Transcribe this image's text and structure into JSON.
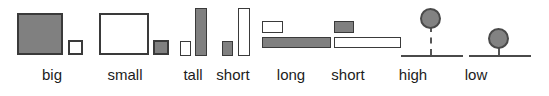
{
  "figure": {
    "title": "",
    "background_color": "#ffffff",
    "stroke_color": "#3a3a3a",
    "fill_gray": "#808080",
    "fill_white": "#ffffff",
    "width": 549,
    "height": 96
  },
  "groups": [
    {
      "label": "big",
      "concept": "size-area",
      "target_shape": "large-gray-square",
      "contrast_shape": "small-white-square"
    },
    {
      "label": "small",
      "concept": "size-area",
      "target_shape": "small-gray-square",
      "contrast_shape": "large-white-square"
    },
    {
      "label": "tall",
      "concept": "height",
      "target_shape": "tall-gray-bar",
      "contrast_shape": "short-white-bar"
    },
    {
      "label": "short",
      "concept": "height",
      "target_shape": "short-gray-bar",
      "contrast_shape": "tall-white-bar"
    },
    {
      "label": "long",
      "concept": "length",
      "target_shape": "long-gray-bar",
      "contrast_shape": "short-white-bar"
    },
    {
      "label": "short",
      "concept": "length",
      "target_shape": "short-gray-bar",
      "contrast_shape": "long-white-bar"
    },
    {
      "label": "high",
      "concept": "vertical-position",
      "target_shape": "gray-circle-high-above-baseline",
      "contrast_shape": "baseline-with-dashed-connector"
    },
    {
      "label": "low",
      "concept": "vertical-position",
      "target_shape": "gray-circle-low-above-baseline",
      "contrast_shape": "baseline-with-dashed-connector"
    }
  ],
  "labels": {
    "big": "big",
    "small": "small",
    "tall": "tall",
    "short_height": "short",
    "long": "long",
    "short_length": "short",
    "high": "high",
    "low": "low"
  }
}
